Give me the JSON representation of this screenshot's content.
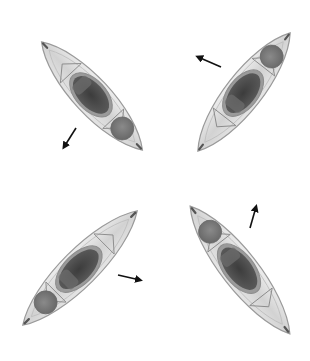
{
  "diagram": {
    "colors": {
      "background": "#ffffff",
      "hull": "#dcdcdc",
      "hull_edge": "#9a9a9a",
      "cockpit_rim": "#8c8c8c",
      "cockpit": "#4a4a4a",
      "hatch": "#7a7a7a",
      "arrow": "#111111"
    },
    "kayaks": [
      {
        "id": "top-left",
        "cx": 92,
        "cy": 96,
        "angle": 47,
        "length": 148,
        "width": 46,
        "hatch_side": "stern"
      },
      {
        "id": "top-right",
        "cx": 244,
        "cy": 92,
        "angle": -52,
        "length": 150,
        "width": 46,
        "hatch_side": "stern"
      },
      {
        "id": "bottom-left",
        "cx": 80,
        "cy": 268,
        "angle": -45,
        "length": 162,
        "width": 46,
        "hatch_side": "bow"
      },
      {
        "id": "bottom-right",
        "cx": 240,
        "cy": 270,
        "angle": 52,
        "length": 162,
        "width": 46,
        "hatch_side": "bow"
      }
    ],
    "arrows": [
      {
        "id": "arrow-top-left",
        "x1": 76,
        "y1": 128,
        "x2": 64,
        "y2": 147
      },
      {
        "id": "arrow-top-right",
        "x1": 221,
        "y1": 67,
        "x2": 198,
        "y2": 57
      },
      {
        "id": "arrow-bottom-left",
        "x1": 118,
        "y1": 275,
        "x2": 140,
        "y2": 280
      },
      {
        "id": "arrow-bottom-right",
        "x1": 250,
        "y1": 228,
        "x2": 256,
        "y2": 207
      }
    ]
  }
}
